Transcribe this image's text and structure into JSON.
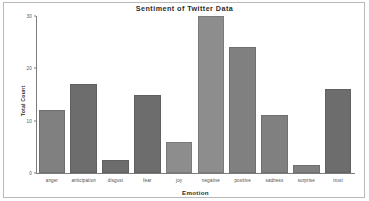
{
  "chart_data": {
    "type": "bar",
    "title": "Sentiment of Twitter Data",
    "xlabel": "Emotion",
    "ylabel": "Total Count",
    "categories": [
      "anger",
      "anticipation",
      "disgust",
      "fear",
      "joy",
      "negative",
      "positive",
      "sadness",
      "surprise",
      "trust"
    ],
    "values": [
      12,
      17,
      2.5,
      15,
      6,
      30,
      24,
      11,
      1.5,
      16
    ],
    "ylim": [
      0,
      30
    ],
    "yticks": [
      0,
      10,
      20,
      30
    ],
    "ytick_labels": [
      "0",
      "10",
      "20",
      "30"
    ],
    "grid": false,
    "legend": false,
    "bar_color": "#808080",
    "bar_shades": [
      "normal",
      "dark",
      "dark",
      "dark",
      "light",
      "light",
      "normal",
      "normal",
      "normal",
      "dark"
    ]
  }
}
